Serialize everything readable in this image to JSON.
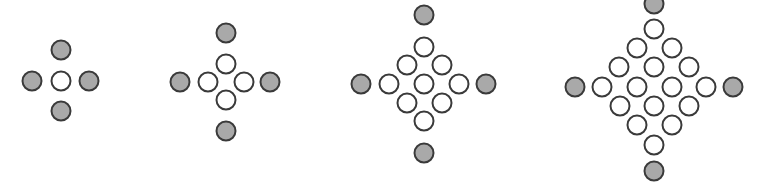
{
  "colors": {
    "gray_fill": "#a9a9a9",
    "white_fill": "#ffffff",
    "stroke": "#3a3a3a"
  },
  "patterns": [
    {
      "name": "pattern-1",
      "gray": [
        [
          61,
          50
        ],
        [
          32,
          81
        ],
        [
          89,
          81
        ],
        [
          61,
          111
        ]
      ],
      "white": [
        [
          61,
          81
        ]
      ]
    },
    {
      "name": "pattern-2",
      "gray": [
        [
          226,
          33
        ],
        [
          180,
          82
        ],
        [
          270,
          82
        ],
        [
          226,
          131
        ]
      ],
      "white": [
        [
          226,
          64
        ],
        [
          208,
          82
        ],
        [
          244,
          82
        ],
        [
          226,
          100
        ]
      ]
    },
    {
      "name": "pattern-3",
      "gray": [
        [
          424,
          15
        ],
        [
          361,
          84
        ],
        [
          486,
          84
        ],
        [
          424,
          153
        ]
      ],
      "white": [
        [
          424,
          47
        ],
        [
          407,
          65
        ],
        [
          442,
          65
        ],
        [
          389,
          84
        ],
        [
          424,
          84
        ],
        [
          459,
          84
        ],
        [
          407,
          103
        ],
        [
          442,
          103
        ],
        [
          424,
          121
        ]
      ]
    },
    {
      "name": "pattern-4",
      "gray": [
        [
          654,
          4
        ],
        [
          575,
          87
        ],
        [
          733,
          87
        ],
        [
          654,
          171
        ]
      ],
      "white": [
        [
          654,
          29
        ],
        [
          637,
          48
        ],
        [
          672,
          48
        ],
        [
          619,
          67
        ],
        [
          654,
          67
        ],
        [
          689,
          67
        ],
        [
          602,
          87
        ],
        [
          637,
          87
        ],
        [
          672,
          87
        ],
        [
          706,
          87
        ],
        [
          620,
          106
        ],
        [
          654,
          106
        ],
        [
          689,
          106
        ],
        [
          637,
          125
        ],
        [
          672,
          125
        ],
        [
          654,
          145
        ]
      ]
    }
  ]
}
